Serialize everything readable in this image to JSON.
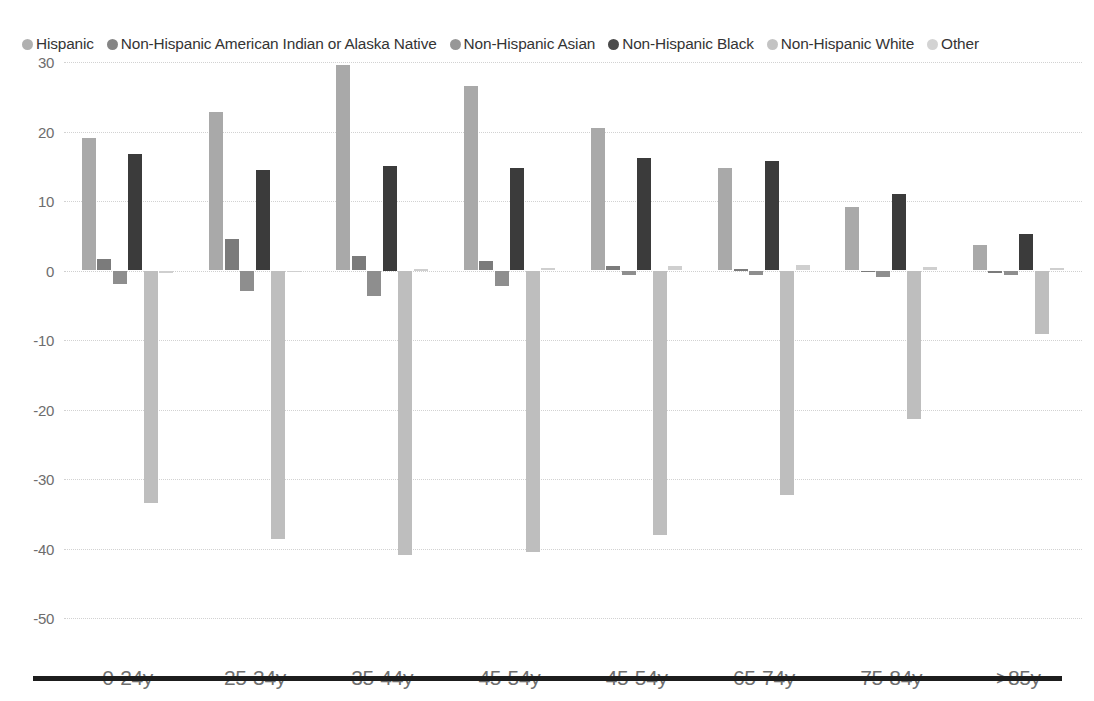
{
  "legend": {
    "items": [
      {
        "label": "Hispanic",
        "color": "#a9a9a9",
        "icon": "legend-dot-icon"
      },
      {
        "label": "Non-Hispanic American Indian or Alaska Native",
        "color": "#7b7b7b",
        "icon": "legend-dot-icon"
      },
      {
        "label": "Non-Hispanic Asian",
        "color": "#8e8e8e",
        "icon": "legend-dot-icon"
      },
      {
        "label": "Non-Hispanic Black",
        "color": "#3b3b3b",
        "icon": "legend-dot-icon"
      },
      {
        "label": "Non-Hispanic White",
        "color": "#bebebe",
        "icon": "legend-dot-icon"
      },
      {
        "label": "Other",
        "color": "#cfcfcf",
        "icon": "legend-dot-icon"
      }
    ]
  },
  "axis": {
    "yticks": [
      "30",
      "20",
      "10",
      "0",
      "-10",
      "-20",
      "-30",
      "-40",
      "-50"
    ],
    "ytick_values": [
      30,
      20,
      10,
      0,
      -10,
      -20,
      -30,
      -40,
      -50
    ]
  },
  "chart_data": {
    "type": "bar",
    "title": "",
    "subtitle": "",
    "xlabel": "",
    "ylabel": "",
    "ylim": [
      -50,
      30
    ],
    "ytick_step": 10,
    "grid": true,
    "legend_position": "top",
    "orientation": "vertical-grouped",
    "categories": [
      "0-24y",
      "25-34y",
      "35-44y",
      "45-54y",
      "45-54y",
      "65-74y",
      "75-84y",
      ">85y"
    ],
    "series": [
      {
        "name": "Hispanic",
        "color": "#a9a9a9",
        "values": [
          19.1,
          22.8,
          29.5,
          26.5,
          20.5,
          14.7,
          9.2,
          3.6
        ]
      },
      {
        "name": "Non-Hispanic American Indian or Alaska Native",
        "color": "#7b7b7b",
        "values": [
          1.7,
          4.6,
          2.1,
          1.4,
          0.7,
          0.2,
          0.0,
          -0.3
        ]
      },
      {
        "name": "Non-Hispanic Asian",
        "color": "#8e8e8e",
        "values": [
          -2.0,
          -2.9,
          -3.6,
          -2.2,
          -0.7,
          -0.6,
          -0.9,
          -0.7
        ]
      },
      {
        "name": "Non-Hispanic Black",
        "color": "#3b3b3b",
        "values": [
          16.8,
          14.5,
          15.0,
          14.8,
          16.2,
          15.8,
          11.0,
          5.2
        ]
      },
      {
        "name": "Non-Hispanic White",
        "color": "#bebebe",
        "values": [
          -33.5,
          -38.7,
          -41.0,
          -40.5,
          -38.0,
          -32.3,
          -21.3,
          -9.2
        ]
      },
      {
        "name": "Other",
        "color": "#cfcfcf",
        "values": [
          -0.3,
          -0.2,
          0.2,
          0.4,
          0.6,
          0.8,
          0.5,
          0.3
        ]
      }
    ]
  }
}
